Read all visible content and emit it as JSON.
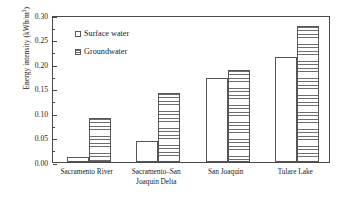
{
  "chart_data": {
    "type": "bar",
    "title": "",
    "xlabel": "",
    "ylabel": "Energy intensity (kWh/m3)",
    "ylabel_text": "Energy intensity (kWh/m",
    "ylabel_sup": "3",
    "ylabel_tail": ")",
    "ylim": [
      0,
      0.3
    ],
    "yticks": [
      "0.00",
      "0.05",
      "0.10",
      "0.15",
      "0.20",
      "0.25",
      "0.30"
    ],
    "ytick_values": [
      0.0,
      0.05,
      0.1,
      0.15,
      0.2,
      0.25,
      0.3
    ],
    "grid": false,
    "legend_position": "upper-left-inside",
    "categories": [
      "Sacramento River",
      "Sacramento–San\nJoaquin Delta",
      "San Joaquin",
      "Tulare Lake"
    ],
    "series": [
      {
        "name": "Surface water",
        "values": [
          0.01,
          0.042,
          0.172,
          0.214
        ],
        "fill": "empty",
        "color": "#ffffff",
        "edge": "#555555"
      },
      {
        "name": "Groundwater",
        "values": [
          0.09,
          0.141,
          0.187,
          0.278
        ],
        "fill": "horizontal-hatch",
        "color": "#6d6d6d",
        "edge": "#555555"
      }
    ]
  },
  "legend": {
    "items": [
      {
        "label": "Surface water",
        "swatch": "surface"
      },
      {
        "label": "Groundwater",
        "swatch": "ground"
      }
    ]
  }
}
